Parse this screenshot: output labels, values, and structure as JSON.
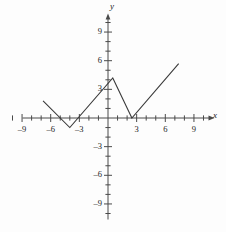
{
  "figure": {
    "axis_labels": {
      "x": "x",
      "y": "y"
    },
    "colors": {
      "axis": "#4a4a4a",
      "curve": "#3a3a3a",
      "text": "#1b1b1b",
      "background": "#fdfdfd"
    }
  },
  "chart_data": {
    "type": "line",
    "title": "",
    "xlabel": "x",
    "ylabel": "y",
    "xlim": [
      -10,
      10
    ],
    "ylim": [
      -10,
      10
    ],
    "grid": false,
    "legend": null,
    "x_ticks": [
      -9,
      -6,
      -3,
      3,
      6,
      9
    ],
    "x_tick_labels": [
      "–9",
      "–6",
      "–3",
      "3",
      "6",
      "9"
    ],
    "y_ticks": [
      9,
      6,
      3,
      -3,
      -6,
      -9
    ],
    "y_tick_labels": [
      "9",
      "6",
      "3",
      "–3",
      "–6",
      "–9"
    ],
    "minor_tick_interval": 1,
    "series": [
      {
        "name": "piecewise-absolute-value",
        "points": [
          {
            "x": -6.8,
            "y": 1.8
          },
          {
            "x": -4.0,
            "y": -1.0
          },
          {
            "x": 0.5,
            "y": 4.2
          },
          {
            "x": 2.5,
            "y": 0.0
          },
          {
            "x": 7.4,
            "y": 5.7
          }
        ]
      }
    ],
    "vertices": [
      {
        "x": -4.0,
        "y": -1.0,
        "kind": "minimum"
      },
      {
        "x": 0.5,
        "y": 4.2,
        "kind": "maximum"
      },
      {
        "x": 2.5,
        "y": 0.0,
        "kind": "minimum"
      }
    ]
  }
}
